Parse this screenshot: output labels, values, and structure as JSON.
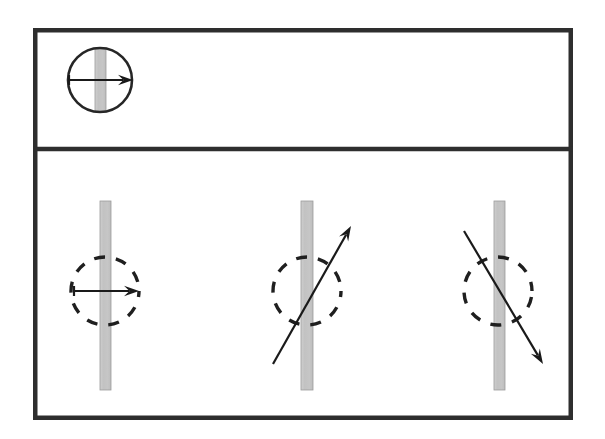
{
  "figure": {
    "canvas": {
      "width": 605,
      "height": 439,
      "background": "#ffffff"
    },
    "frame": {
      "x": 33,
      "y": 28,
      "width": 540,
      "height": 392,
      "stroke_color": "#2e2e2e",
      "stroke_width": 4.5,
      "divider_y": 149,
      "divider_width": 4.5
    },
    "colors": {
      "bar_fill": "#c4c4c4",
      "bar_stroke": "#9b9b9b",
      "ink": "#1a1a1a",
      "circle_solid": "#262626",
      "circle_dashed": "#1f1f1f",
      "background": "#ffffff"
    },
    "panels": [
      {
        "name": "top-panel",
        "label": "reference",
        "y_range": [
          28,
          149
        ]
      },
      {
        "name": "bottom-panel",
        "label": "orientations",
        "y_range": [
          151,
          420
        ]
      }
    ],
    "top_figure": {
      "name": "reference-figure",
      "circle": {
        "cx": 100,
        "cy": 80,
        "r": 32,
        "style": "solid"
      },
      "bar": {
        "x": 95,
        "y": 48,
        "width": 11,
        "height": 64,
        "orientation": "vertical"
      },
      "vector": {
        "x1": 69,
        "y1": 80,
        "x2": 133,
        "y2": 80,
        "angle_deg": 0,
        "direction": "right",
        "has_tail_cap": true
      }
    },
    "bottom_figures": [
      {
        "name": "figure-horizontal",
        "index": 1,
        "circle": {
          "cx": 105,
          "cy": 291,
          "r": 34,
          "style": "dashed"
        },
        "bar": {
          "x": 100,
          "y": 201,
          "width": 11,
          "height": 189,
          "orientation": "vertical"
        },
        "vector": {
          "x1": 74,
          "y1": 291,
          "x2": 139,
          "y2": 291,
          "angle_deg": 0,
          "direction": "right",
          "has_tail_cap": true
        }
      },
      {
        "name": "figure-diagonal-up",
        "index": 2,
        "circle": {
          "cx": 307,
          "cy": 291,
          "r": 34,
          "style": "dashed"
        },
        "bar": {
          "x": 301,
          "y": 201,
          "width": 12,
          "height": 189,
          "orientation": "vertical"
        },
        "vector": {
          "x1": 273,
          "y1": 364,
          "x2": 351,
          "y2": 226,
          "angle_deg": 60,
          "direction": "up-right",
          "has_tail_cap": false
        }
      },
      {
        "name": "figure-diagonal-down",
        "index": 3,
        "circle": {
          "cx": 498,
          "cy": 291,
          "r": 34,
          "style": "dashed"
        },
        "bar": {
          "x": 494,
          "y": 201,
          "width": 11,
          "height": 189,
          "orientation": "vertical"
        },
        "vector": {
          "x1": 464,
          "y1": 231,
          "x2": 543,
          "y2": 364,
          "angle_deg": -59,
          "direction": "down-right",
          "has_tail_cap": false
        }
      }
    ],
    "dash_pattern": {
      "dash": 11,
      "gap": 11
    }
  }
}
